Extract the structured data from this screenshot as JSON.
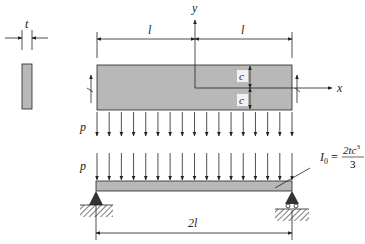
{
  "labels": {
    "thickness": "t",
    "half_length_left": "l",
    "half_length_right": "l",
    "y_axis": "y",
    "x_axis": "x",
    "half_depth_top": "c",
    "half_depth_bottom": "c",
    "load_top": "p",
    "load_bottom": "p",
    "span": "2l",
    "inertia_lhs": "I",
    "inertia_sub": "0",
    "inertia_eq": "=",
    "inertia_num": "2tc",
    "inertia_exp": "3",
    "inertia_den": "3"
  },
  "colors": {
    "beam_fill": "#b8b8b8",
    "line": "#222222"
  },
  "load_arrow_count": 17
}
